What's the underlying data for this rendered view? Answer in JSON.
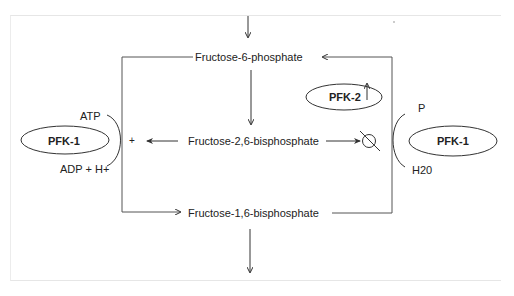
{
  "diagram": {
    "nodes": {
      "f6p": "Fructose-6-phosphate",
      "f26bp": "Fructose-2,6-bisphosphate",
      "f16bp": "Fructose-1,6-bisphosphate"
    },
    "enzymes": {
      "pfk1_left": "PFK-1",
      "pfk2": "PFK-2",
      "pfk1_right": "PFK-1"
    },
    "cofactors": {
      "atp": "ATP",
      "adp_h": "ADP + H+",
      "p": "P",
      "h2o": "H20"
    },
    "symbols": {
      "plus": "+",
      "inhibit": "inhibit-symbol",
      "up_arrow": "up-arrow"
    },
    "colors": {
      "line": "#333333",
      "frame": "#e6e6e6",
      "text": "#222222"
    }
  }
}
